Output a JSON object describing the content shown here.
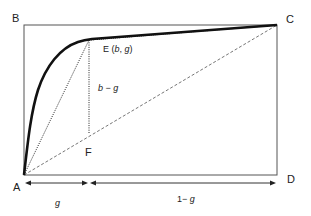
{
  "diagram": {
    "type": "lorenz-curve-geometry",
    "points": {
      "A": {
        "label": "A",
        "x": 24,
        "y": 175
      },
      "B": {
        "label": "B",
        "x": 24,
        "y": 25
      },
      "C": {
        "label": "C",
        "x": 277,
        "y": 25
      },
      "D": {
        "label": "D",
        "x": 277,
        "y": 175
      },
      "E": {
        "label": "E (b, g)",
        "x": 89,
        "y": 40
      },
      "F": {
        "label": "F",
        "x": 89,
        "y": 134
      }
    },
    "labels": {
      "B": "B",
      "C": "C",
      "A": "A",
      "D": "D",
      "E": "E (",
      "E_b": "b",
      "E_sep": ", ",
      "E_g": "g",
      "E_close": ")",
      "F": "F",
      "b_minus_g_b": "b",
      "b_minus_g_minus": " − ",
      "b_minus_g_g": "g",
      "g": "g",
      "one_minus_g_prefix": "1− ",
      "one_minus_g_g": "g"
    },
    "lines": {
      "curve": "solid thick curve from A to C via E",
      "AE": "dotted",
      "EF": "dotted vertical",
      "EC": "dotted",
      "AC": "dashed diagonal"
    },
    "colors": {
      "stroke": "#111111",
      "frame": "#555555",
      "dashed": "#666666",
      "text": "#222222"
    }
  }
}
